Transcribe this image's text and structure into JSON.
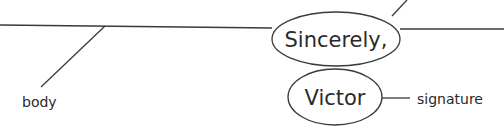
{
  "diagram": {
    "type": "sentence-diagram",
    "nodes": {
      "closing": "Sincerely,",
      "signer": "Victor"
    },
    "labels": {
      "body": "body",
      "signature": "signature",
      "top_clipped": "closing"
    },
    "colors": {
      "stroke": "#3a3a3a",
      "text": "#2a2a2a",
      "background": "#ffffff"
    }
  }
}
